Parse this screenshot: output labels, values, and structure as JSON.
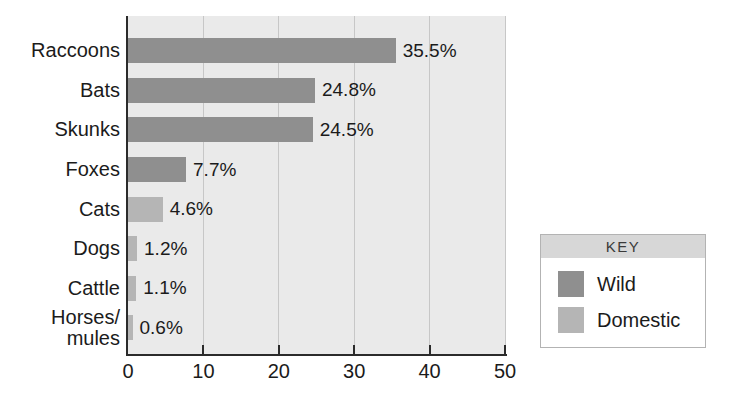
{
  "chart_data": {
    "type": "bar",
    "orientation": "horizontal",
    "title": "",
    "xlabel": "",
    "ylabel": "",
    "categories": [
      "Raccoons",
      "Bats",
      "Skunks",
      "Foxes",
      "Cats",
      "Dogs",
      "Cattle",
      "Horses/\nmules"
    ],
    "values": [
      35.5,
      24.8,
      24.5,
      7.7,
      4.6,
      1.2,
      1.1,
      0.6
    ],
    "value_labels": [
      "35.5%",
      "24.8%",
      "24.5%",
      "7.7%",
      "4.6%",
      "1.2%",
      "1.1%",
      "0.6%"
    ],
    "groups": [
      "Wild",
      "Wild",
      "Wild",
      "Wild",
      "Domestic",
      "Domestic",
      "Domestic",
      "Domestic"
    ],
    "xlim": [
      0,
      50
    ],
    "xticks": [
      0,
      10,
      20,
      30,
      40,
      50
    ],
    "grid": true,
    "legend": {
      "title": "KEY",
      "position": "right",
      "entries": [
        {
          "label": "Wild",
          "color": "#8f8f8f"
        },
        {
          "label": "Domestic",
          "color": "#b5b5b5"
        }
      ]
    }
  },
  "colors": {
    "wild_bar": "#8f8f8f",
    "domestic_bar": "#b5b5b5",
    "plot_background": "#eaeaea",
    "gridline": "#c7c7c7",
    "axis": "#2b2b2b",
    "text": "#1b1b1b",
    "legend_header_background": "#d7d7d7",
    "legend_border": "#b3b3b3"
  }
}
